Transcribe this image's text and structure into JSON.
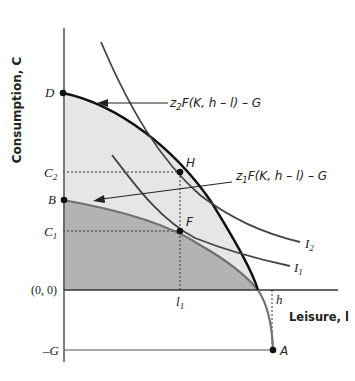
{
  "diagram": {
    "type": "production-possibilities-frontier",
    "axes": {
      "y_label": "Consumption, C",
      "x_label": "Leisure, l",
      "origin_label": "(0, 0)"
    },
    "y_ticks": {
      "D": "D",
      "C2": "C",
      "C2_sub": "2",
      "B": "B",
      "C1": "C",
      "C1_sub": "1",
      "negG": "–G"
    },
    "x_ticks": {
      "l1": "l",
      "l1_sub": "1",
      "h": "h"
    },
    "points": {
      "D": "D",
      "H": "H",
      "B": "B",
      "F": "F",
      "A": "A"
    },
    "curves": {
      "ppf_high": {
        "label_z": "z",
        "label_z_sub": "2",
        "label_rest": "F(K, h – l) – G"
      },
      "ppf_low": {
        "label_z": "z",
        "label_z_sub": "1",
        "label_rest": "F(K, h – l) – G"
      },
      "I2": {
        "label": "I",
        "sub": "2"
      },
      "I1": {
        "label": "I",
        "sub": "1"
      }
    },
    "colors": {
      "light_fill": "#e6e6e6",
      "dark_fill": "#b3b3b3",
      "ppf_high_stroke": "#111111",
      "ppf_low_stroke": "#707070",
      "indiff_stroke": "#444444",
      "axis": "#333333"
    }
  }
}
